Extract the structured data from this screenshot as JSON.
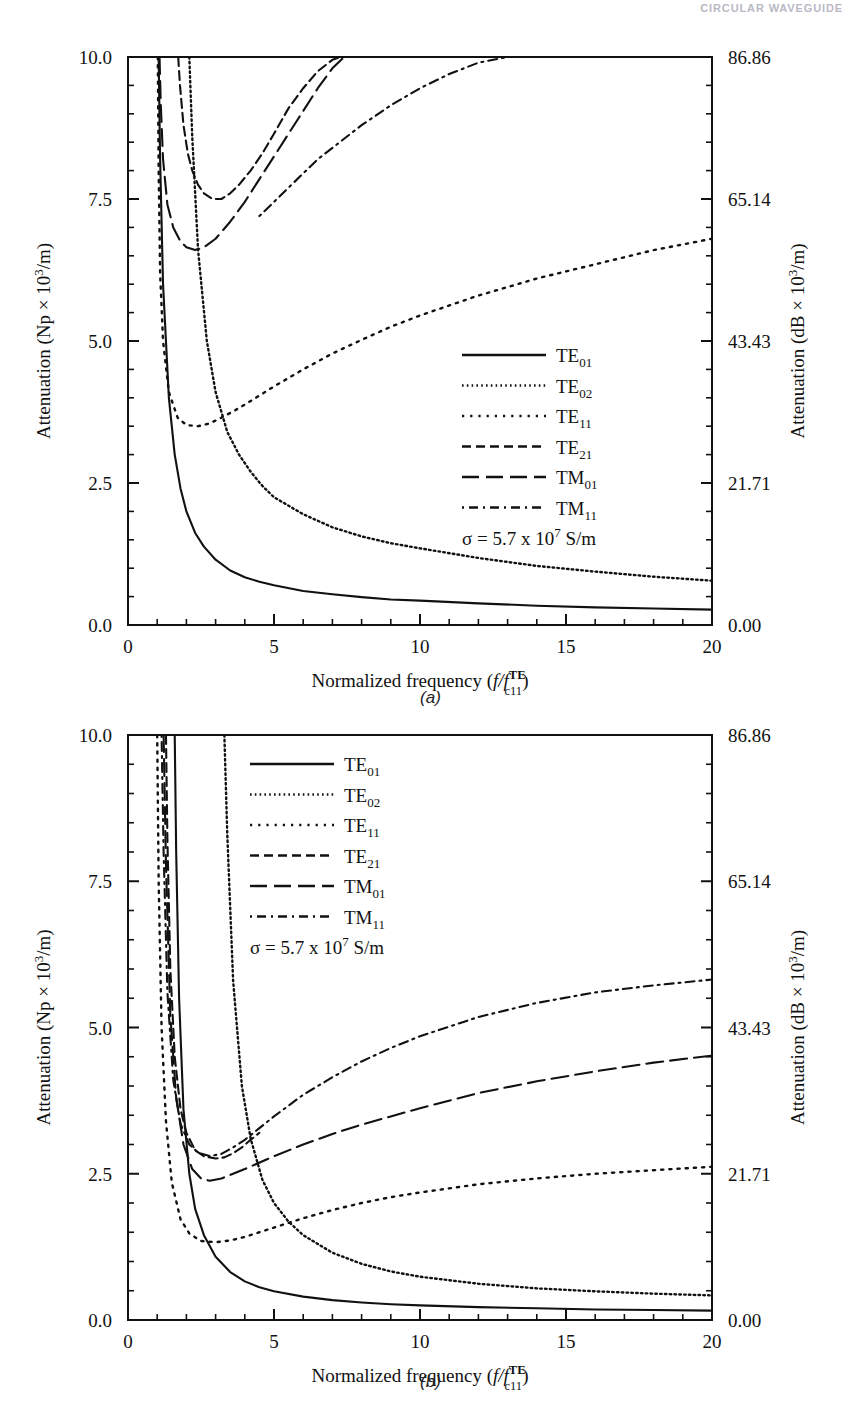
{
  "runningHead": "CIRCULAR WAVEGUIDE",
  "figures": [
    {
      "caption": "(a)",
      "annotation": "σ = 5.7 x 10",
      "annotation_exp": "7",
      "annotation_tail": " S/m",
      "axes": {
        "xlabel_main": "Normalized frequency (",
        "xlabel_f": "f",
        "xlabel_slash": "/",
        "xlabel_f2": "f",
        "xlabel_sup": "TE",
        "xlabel_sub": "c11",
        "xlabel_close": ")",
        "ylabel_left": "Attenuation (Np × 10³/m)",
        "ylabel_right": "Attenuation (dB × 10³/m)",
        "xticks": [
          "0",
          "5",
          "10",
          "15",
          "20"
        ],
        "xtickvals": [
          0,
          5,
          10,
          15,
          20
        ],
        "yticks": [
          "0.0",
          "2.5",
          "5.0",
          "7.5",
          "10.0"
        ],
        "ytickvals": [
          0,
          2.5,
          5.0,
          7.5,
          10.0
        ],
        "yticks_right": [
          "0.00",
          "21.71",
          "43.43",
          "65.14",
          "86.86"
        ],
        "xlim": [
          0,
          20
        ],
        "ylim": [
          0,
          10
        ],
        "xminor": 1,
        "yminor": 0.5,
        "grid": false
      },
      "legend": {
        "position": "center-right",
        "entries": [
          {
            "label_main": "TE",
            "label_sub": "01",
            "dash": "solid"
          },
          {
            "label_main": "TE",
            "label_sub": "02",
            "dash": "fine-dot"
          },
          {
            "label_main": "TE",
            "label_sub": "11",
            "dash": "dot"
          },
          {
            "label_main": "TE",
            "label_sub": "21",
            "dash": "dash"
          },
          {
            "label_main": "TM",
            "label_sub": "01",
            "dash": "long-dash"
          },
          {
            "label_main": "TM",
            "label_sub": "11",
            "dash": "dash-dot"
          }
        ]
      }
    },
    {
      "caption": "(b)",
      "annotation": "σ = 5.7 x 10",
      "annotation_exp": "7",
      "annotation_tail": " S/m",
      "axes": {
        "xlabel_main": "Normalized frequency (",
        "xlabel_f": "f",
        "xlabel_slash": "/",
        "xlabel_f2": "f",
        "xlabel_sup": "TE",
        "xlabel_sub": "c11",
        "xlabel_close": ")",
        "ylabel_left": "Attenuation (Np × 10³/m)",
        "ylabel_right": "Attenuation (dB × 10³/m)",
        "xticks": [
          "0",
          "5",
          "10",
          "15",
          "20"
        ],
        "xtickvals": [
          0,
          5,
          10,
          15,
          20
        ],
        "yticks": [
          "0.0",
          "2.5",
          "5.0",
          "7.5",
          "10.0"
        ],
        "ytickvals": [
          0,
          2.5,
          5.0,
          7.5,
          10.0
        ],
        "yticks_right": [
          "0.00",
          "21.71",
          "43.43",
          "65.14",
          "86.86"
        ],
        "xlim": [
          0,
          20
        ],
        "ylim": [
          0,
          10
        ],
        "xminor": 1,
        "yminor": 0.5,
        "grid": false
      },
      "legend": {
        "position": "top-left-inside",
        "entries": [
          {
            "label_main": "TE",
            "label_sub": "01",
            "dash": "solid"
          },
          {
            "label_main": "TE",
            "label_sub": "02",
            "dash": "fine-dot"
          },
          {
            "label_main": "TE",
            "label_sub": "11",
            "dash": "dot"
          },
          {
            "label_main": "TE",
            "label_sub": "21",
            "dash": "dash"
          },
          {
            "label_main": "TM",
            "label_sub": "01",
            "dash": "long-dash"
          },
          {
            "label_main": "TM",
            "label_sub": "11",
            "dash": "dash-dot"
          }
        ]
      }
    }
  ],
  "chart_data": [
    {
      "type": "line",
      "title": "(a)",
      "xlabel": "Normalized frequency (f/f_c11^TE)",
      "ylabel": "Attenuation (Np x 10^3/m)",
      "ylabel2": "Attenuation (dB x 10^3/m)",
      "xlim": [
        0,
        20
      ],
      "ylim": [
        0,
        10
      ],
      "grid": false,
      "legend_position": "center-right",
      "annotation": "sigma = 5.7 x 10^7 S/m",
      "series": [
        {
          "name": "TE01",
          "dash": "solid",
          "x": [
            1.05,
            1.1,
            1.2,
            1.4,
            1.6,
            1.8,
            2.0,
            2.3,
            2.6,
            3.0,
            3.5,
            4.0,
            4.5,
            5.0,
            6.0,
            7.0,
            8.0,
            9.0,
            10.0,
            12.0,
            14.0,
            16.0,
            18.0,
            20.0
          ],
          "y": [
            10.0,
            8.2,
            6.0,
            4.0,
            3.0,
            2.4,
            2.0,
            1.62,
            1.38,
            1.15,
            0.96,
            0.84,
            0.76,
            0.7,
            0.6,
            0.54,
            0.49,
            0.45,
            0.43,
            0.38,
            0.34,
            0.31,
            0.29,
            0.27
          ]
        },
        {
          "name": "TE02",
          "dash": "fine-dot",
          "x": [
            2.1,
            2.2,
            2.4,
            2.7,
            3.0,
            3.4,
            3.8,
            4.2,
            4.6,
            5.0,
            6.0,
            7.0,
            8.0,
            9.0,
            10.0,
            12.0,
            14.0,
            16.0,
            18.0,
            20.0
          ],
          "y": [
            10.0,
            8.6,
            6.6,
            5.0,
            4.1,
            3.4,
            3.0,
            2.7,
            2.45,
            2.25,
            1.95,
            1.72,
            1.56,
            1.44,
            1.35,
            1.18,
            1.04,
            0.94,
            0.85,
            0.78
          ]
        },
        {
          "name": "TE11",
          "dash": "dot",
          "x": [
            1.02,
            1.05,
            1.1,
            1.2,
            1.4,
            1.7,
            2.0,
            2.4,
            2.8,
            3.2,
            3.6,
            4.0,
            4.5,
            5.0,
            6.0,
            7.0,
            8.0,
            9.0,
            10.0,
            12.0,
            14.0,
            16.0,
            18.0,
            20.0
          ],
          "y": [
            10.0,
            8.0,
            6.2,
            5.0,
            4.1,
            3.65,
            3.52,
            3.5,
            3.55,
            3.65,
            3.76,
            3.88,
            4.04,
            4.2,
            4.5,
            4.78,
            5.02,
            5.25,
            5.45,
            5.8,
            6.1,
            6.35,
            6.6,
            6.8
          ]
        },
        {
          "name": "TE21",
          "dash": "dash",
          "x": [
            1.72,
            1.78,
            1.9,
            2.05,
            2.2,
            2.4,
            2.6,
            2.9,
            3.2,
            3.5,
            3.8,
            4.2,
            4.6,
            5.0,
            5.5,
            6.0,
            6.5,
            7.0,
            7.3
          ],
          "y": [
            10.0,
            9.5,
            8.8,
            8.3,
            8.0,
            7.75,
            7.6,
            7.5,
            7.5,
            7.6,
            7.75,
            8.0,
            8.3,
            8.65,
            9.1,
            9.45,
            9.75,
            9.95,
            10.0
          ]
        },
        {
          "name": "TM01",
          "dash": "long-dash",
          "x": [
            1.08,
            1.12,
            1.2,
            1.35,
            1.55,
            1.8,
            2.0,
            2.3,
            2.6,
            3.0,
            3.5,
            4.0,
            4.5,
            5.0,
            5.5,
            6.0,
            6.5,
            7.0,
            7.4
          ],
          "y": [
            10.0,
            9.2,
            8.2,
            7.4,
            7.0,
            6.75,
            6.65,
            6.6,
            6.65,
            6.8,
            7.1,
            7.45,
            7.85,
            8.25,
            8.65,
            9.05,
            9.45,
            9.8,
            10.0
          ]
        },
        {
          "name": "TM11",
          "dash": "dash-dot",
          "x": [
            4.5,
            5.0,
            5.5,
            6.0,
            6.5,
            7.0,
            7.5,
            8.0,
            9.0,
            10.0,
            11.0,
            12.0,
            13.0
          ],
          "y": [
            7.2,
            7.45,
            7.7,
            7.95,
            8.2,
            8.4,
            8.6,
            8.8,
            9.15,
            9.45,
            9.7,
            9.9,
            10.0
          ]
        }
      ]
    },
    {
      "type": "line",
      "title": "(b)",
      "xlabel": "Normalized frequency (f/f_c11^TE)",
      "ylabel": "Attenuation (Np x 10^3/m)",
      "ylabel2": "Attenuation (dB x 10^3/m)",
      "xlim": [
        0,
        20
      ],
      "ylim": [
        0,
        10
      ],
      "grid": false,
      "legend_position": "top-left-inside",
      "annotation": "sigma = 5.7 x 10^7 S/m",
      "series": [
        {
          "name": "TE01",
          "dash": "solid",
          "x": [
            1.6,
            1.65,
            1.75,
            1.9,
            2.1,
            2.3,
            2.6,
            3.0,
            3.5,
            4.0,
            4.5,
            5.0,
            6.0,
            7.0,
            8.0,
            9.0,
            10.0,
            12.0,
            14.0,
            16.0,
            18.0,
            20.0
          ],
          "y": [
            10.0,
            8.0,
            5.5,
            3.6,
            2.5,
            1.9,
            1.45,
            1.08,
            0.82,
            0.66,
            0.56,
            0.49,
            0.4,
            0.34,
            0.3,
            0.27,
            0.25,
            0.22,
            0.2,
            0.18,
            0.17,
            0.16
          ]
        },
        {
          "name": "TE02",
          "dash": "fine-dot",
          "x": [
            3.3,
            3.4,
            3.6,
            3.9,
            4.2,
            4.6,
            5.0,
            5.5,
            6.0,
            7.0,
            8.0,
            9.0,
            10.0,
            12.0,
            14.0,
            16.0,
            18.0,
            20.0
          ],
          "y": [
            10.0,
            8.3,
            5.8,
            4.0,
            3.1,
            2.4,
            2.0,
            1.68,
            1.45,
            1.15,
            0.96,
            0.83,
            0.74,
            0.62,
            0.54,
            0.49,
            0.45,
            0.42
          ]
        },
        {
          "name": "TE11",
          "dash": "dot",
          "x": [
            1.0,
            1.05,
            1.15,
            1.3,
            1.5,
            1.8,
            2.1,
            2.5,
            3.0,
            3.5,
            4.0,
            4.5,
            5.0,
            6.0,
            7.0,
            8.0,
            9.0,
            10.0,
            12.0,
            14.0,
            16.0,
            18.0,
            20.0
          ],
          "y": [
            10.0,
            7.5,
            5.0,
            3.4,
            2.35,
            1.72,
            1.48,
            1.35,
            1.33,
            1.36,
            1.42,
            1.5,
            1.58,
            1.74,
            1.88,
            2.0,
            2.1,
            2.18,
            2.32,
            2.42,
            2.5,
            2.56,
            2.62
          ]
        },
        {
          "name": "TE21",
          "dash": "dash",
          "x": [
            1.3,
            1.35,
            1.45,
            1.6,
            1.8,
            2.0,
            2.3,
            2.6,
            3.0,
            3.3,
            3.6,
            3.9,
            4.2,
            4.5
          ],
          "y": [
            10.0,
            8.2,
            6.0,
            4.5,
            3.6,
            3.2,
            2.9,
            2.8,
            2.76,
            2.78,
            2.85,
            2.95,
            3.08,
            3.2
          ]
        },
        {
          "name": "TM01",
          "dash": "long-dash",
          "x": [
            1.22,
            1.3,
            1.45,
            1.65,
            1.9,
            2.2,
            2.5,
            2.8,
            3.2,
            3.6,
            4.0,
            5.0,
            6.0,
            7.0,
            8.0,
            10.0,
            12.0,
            14.0,
            16.0,
            18.0,
            20.0
          ],
          "y": [
            10.0,
            7.8,
            5.2,
            3.8,
            3.0,
            2.58,
            2.42,
            2.38,
            2.42,
            2.5,
            2.58,
            2.8,
            3.0,
            3.18,
            3.34,
            3.62,
            3.88,
            4.08,
            4.25,
            4.4,
            4.52
          ]
        },
        {
          "name": "TM11",
          "dash": "dash-dot",
          "x": [
            1.15,
            1.22,
            1.35,
            1.55,
            1.8,
            2.1,
            2.4,
            2.8,
            3.2,
            3.6,
            4.0,
            4.5,
            5.0,
            6.0,
            7.0,
            8.0,
            9.0,
            10.0,
            12.0,
            14.0,
            16.0,
            18.0,
            20.0
          ],
          "y": [
            10.0,
            8.0,
            5.6,
            4.1,
            3.35,
            3.0,
            2.86,
            2.8,
            2.84,
            2.95,
            3.08,
            3.28,
            3.48,
            3.85,
            4.15,
            4.42,
            4.65,
            4.85,
            5.18,
            5.42,
            5.6,
            5.72,
            5.82
          ]
        }
      ]
    }
  ]
}
